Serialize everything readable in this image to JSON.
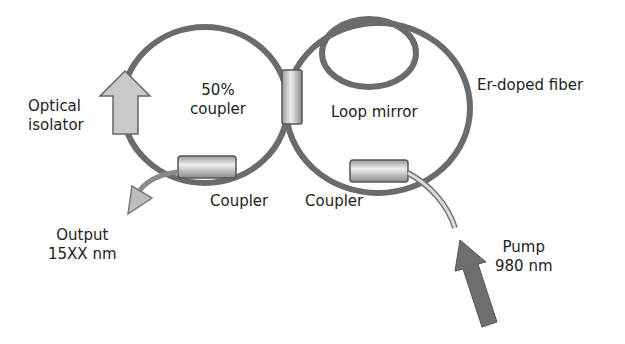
{
  "diagram": {
    "labels": {
      "coupler_50": [
        "50%",
        "coupler"
      ],
      "optical_isolator": [
        "Optical",
        "isolator"
      ],
      "loop_mirror": "Loop mirror",
      "er_fiber": "Er-doped fiber",
      "coupler_left": "Coupler",
      "coupler_right": "Coupler",
      "output": [
        "Output",
        "15XX nm"
      ],
      "pump": [
        "Pump",
        "980 nm"
      ]
    },
    "colors": {
      "fiber": "#6b6b6b",
      "coupler_fill": "#d4d4d4",
      "arrow_light": "#c8c8c8",
      "arrow_dark": "#6e6e6e",
      "text": "#222222"
    }
  }
}
